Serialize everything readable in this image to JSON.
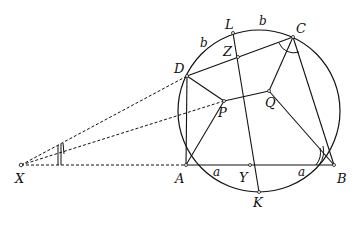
{
  "diagram": {
    "type": "geometry",
    "points": {
      "X": {
        "label": "X",
        "x": 21,
        "y": 165
      },
      "A": {
        "label": "A",
        "x": 186,
        "y": 165
      },
      "B": {
        "label": "B",
        "x": 334,
        "y": 165
      },
      "C": {
        "label": "C",
        "x": 293,
        "y": 37
      },
      "D": {
        "label": "D",
        "x": 187,
        "y": 76
      },
      "L": {
        "label": "L",
        "x": 233,
        "y": 33
      },
      "Z": {
        "label": "Z",
        "x": 238,
        "y": 57
      },
      "P": {
        "label": "P",
        "x": 224,
        "y": 101
      },
      "Q": {
        "label": "Q",
        "x": 269,
        "y": 91
      },
      "Y": {
        "label": "Y",
        "x": 250,
        "y": 165
      },
      "K": {
        "label": "K",
        "x": 259,
        "y": 192
      }
    },
    "arc_labels": {
      "b_left": "b",
      "b_top": "b",
      "a_left": "a",
      "a_right": "a"
    },
    "circle": {
      "cx": 259,
      "cy": 111,
      "r": 81
    }
  }
}
